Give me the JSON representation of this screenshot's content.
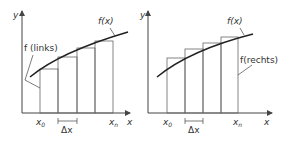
{
  "left_panel": {
    "y_axis_label": "y",
    "x_axis_label": "x",
    "curve_label": "f(x)",
    "method_label": "f (links)",
    "x0_label": "x",
    "x0_sub": "0",
    "xn_label": "x",
    "xn_sub": "n",
    "dx_label": "Δx"
  },
  "right_panel": {
    "y_axis_label": "y",
    "x_axis_label": "x",
    "curve_label": "f(x)",
    "method_label": "f(rechts)",
    "x0_label": "x",
    "x0_sub": "0",
    "xn_label": "x",
    "xn_sub": "n",
    "dx_label": "Δx"
  },
  "colors": {
    "curve": "#222222",
    "axis": "#444444",
    "rect": "#666666",
    "text": "#333333"
  }
}
